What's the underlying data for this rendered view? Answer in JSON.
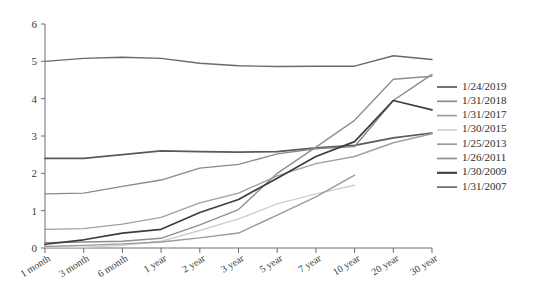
{
  "chart_data": {
    "type": "line",
    "title": "",
    "xlabel": "",
    "ylabel": "",
    "ylim": [
      0,
      6
    ],
    "yticks": [
      0,
      1,
      2,
      3,
      4,
      5,
      6
    ],
    "grid": false,
    "legend_position": "right",
    "categories": [
      "1 month",
      "3 month",
      "6 month",
      "1 year",
      "2 year",
      "3 year",
      "5 year",
      "7 year",
      "10 year",
      "20 year",
      "30 year"
    ],
    "series": [
      {
        "name": "1/24/2019",
        "color": "#5a5a5a",
        "values": [
          2.4,
          2.4,
          2.5,
          2.6,
          2.58,
          2.57,
          2.58,
          2.68,
          2.75,
          2.95,
          3.08
        ]
      },
      {
        "name": "1/31/2018",
        "color": "#8a8a8a",
        "values": [
          1.45,
          1.47,
          1.65,
          1.82,
          2.14,
          2.24,
          2.52,
          2.66,
          2.72,
          3.95,
          4.65
        ]
      },
      {
        "name": "1/31/2017",
        "color": "#a0a0a0",
        "values": [
          0.5,
          0.52,
          0.64,
          0.82,
          1.21,
          1.47,
          1.93,
          2.26,
          2.45,
          2.82,
          3.06
        ]
      },
      {
        "name": "1/30/2015",
        "color": "#cfcfcf",
        "values": [
          0.02,
          0.02,
          0.07,
          0.18,
          0.47,
          0.78,
          1.18,
          1.45,
          1.68,
          null,
          null
        ]
      },
      {
        "name": "1/25/2013",
        "color": "#9a9a9a",
        "values": [
          0.04,
          0.07,
          0.11,
          0.16,
          0.27,
          0.4,
          0.88,
          1.37,
          1.95,
          null,
          null
        ]
      },
      {
        "name": "1/26/2011",
        "color": "#8f8f8f",
        "values": [
          0.14,
          0.16,
          0.18,
          0.26,
          0.62,
          1.03,
          2.0,
          2.7,
          3.42,
          4.52,
          4.6
        ]
      },
      {
        "name": "1/30/2009",
        "color": "#3d3d3d",
        "values": [
          0.1,
          0.22,
          0.4,
          0.5,
          0.95,
          1.3,
          1.87,
          2.45,
          2.85,
          3.95,
          3.7
        ]
      },
      {
        "name": "1/31/2007",
        "color": "#6a6a6a",
        "values": [
          5.0,
          5.08,
          5.11,
          5.08,
          4.95,
          4.88,
          4.86,
          4.87,
          4.87,
          5.15,
          5.05
        ]
      }
    ]
  },
  "legend": {
    "items": [
      {
        "label": "1/24/2019"
      },
      {
        "label": "1/31/2018"
      },
      {
        "label": "1/31/2017"
      },
      {
        "label": "1/30/2015"
      },
      {
        "label": "1/25/2013"
      },
      {
        "label": "1/26/2011"
      },
      {
        "label": "1/30/2009"
      },
      {
        "label": "1/31/2007"
      }
    ]
  }
}
